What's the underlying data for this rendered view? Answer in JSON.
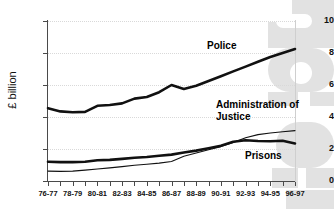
{
  "chart_data": {
    "type": "line",
    "title": "",
    "xlabel": "",
    "ylabel": "£ billion",
    "ylim": [
      0,
      10
    ],
    "yticks": [
      "0",
      "2",
      "4",
      "6",
      "8",
      "10"
    ],
    "grid": true,
    "legend_position": "inline-annotation",
    "x": [
      "76-77",
      "77-78",
      "78-79",
      "79-80",
      "80-81",
      "81-82",
      "82-83",
      "83-84",
      "84-85",
      "85-86",
      "86-87",
      "87-88",
      "88-89",
      "89-90",
      "90-91",
      "91-92",
      "92-93",
      "93-94",
      "94-95",
      "95-96",
      "96-97"
    ],
    "xtick_labels": [
      "76-77",
      "",
      "78-79",
      "",
      "80-81",
      "",
      "82-83",
      "",
      "84-85",
      "",
      "86-87",
      "",
      "88-89",
      "",
      "90-91",
      "",
      "92-93",
      "",
      "94-95",
      "",
      "96-97"
    ],
    "series": [
      {
        "name": "Police",
        "style": "thick-black",
        "values": [
          4.55,
          4.35,
          4.3,
          4.32,
          4.7,
          4.75,
          4.85,
          5.15,
          5.25,
          5.55,
          6.0,
          5.75,
          5.95,
          6.25,
          6.55,
          6.85,
          7.15,
          7.45,
          7.75,
          8.0,
          8.25
        ]
      },
      {
        "name": "Prisons",
        "style": "thick-black",
        "values": [
          1.2,
          1.18,
          1.18,
          1.2,
          1.3,
          1.32,
          1.38,
          1.45,
          1.5,
          1.58,
          1.65,
          1.78,
          1.9,
          2.05,
          2.2,
          2.45,
          2.55,
          2.5,
          2.48,
          2.52,
          2.35
        ]
      },
      {
        "name": "Administration of Justice",
        "style": "thin-black",
        "values": [
          0.62,
          0.6,
          0.62,
          0.68,
          0.75,
          0.82,
          0.9,
          0.98,
          1.05,
          1.12,
          1.22,
          1.55,
          1.75,
          1.95,
          2.15,
          2.4,
          2.7,
          2.9,
          3.0,
          3.08,
          3.15
        ]
      }
    ],
    "annotations": [
      {
        "text": "Police",
        "series": "Police"
      },
      {
        "text": "Administration of Justice",
        "series": "Administration of Justice"
      },
      {
        "text": "Prisons",
        "series": "Prisons"
      }
    ],
    "colors": {
      "series_line": "#111111",
      "axis": "#4a4a4a",
      "grid": "#d9d9d9",
      "background": "#ffffff",
      "watermark": "#e2e2e2"
    }
  }
}
